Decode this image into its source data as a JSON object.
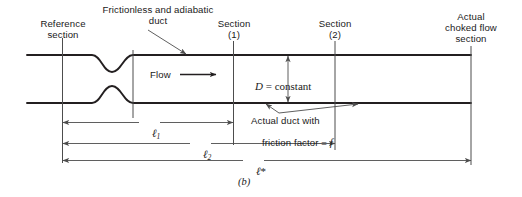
{
  "figure": {
    "caption": "(b)",
    "labels": {
      "reference_section": "Reference\nsection",
      "frictionless_duct": "Frictionless and adiabatic\nduct",
      "section_1": "Section\n(1)",
      "section_2": "Section\n(2)",
      "actual_choked": "Actual\nchoked flow\nsection",
      "flow": "Flow",
      "actual_duct_friction_line1": "Actual duct with",
      "actual_duct_friction_line2_pre": "friction factor = ",
      "actual_duct_friction_f": "f"
    },
    "annotations": {
      "diameter_symbol": "D",
      "diameter_relation": " = constant"
    },
    "dimensions": [
      {
        "name": "ell-1",
        "symbol": "ℓ",
        "subscript": "1",
        "star": false
      },
      {
        "name": "ell-2",
        "symbol": "ℓ",
        "subscript": "2",
        "star": false
      },
      {
        "name": "ell-star",
        "symbol": "ℓ",
        "subscript": "",
        "star": true
      }
    ],
    "colors": {
      "duct_line": "#231f20",
      "thin_line": "#4d4d4d",
      "text": "#1a1a1a",
      "background": "#ffffff"
    }
  }
}
